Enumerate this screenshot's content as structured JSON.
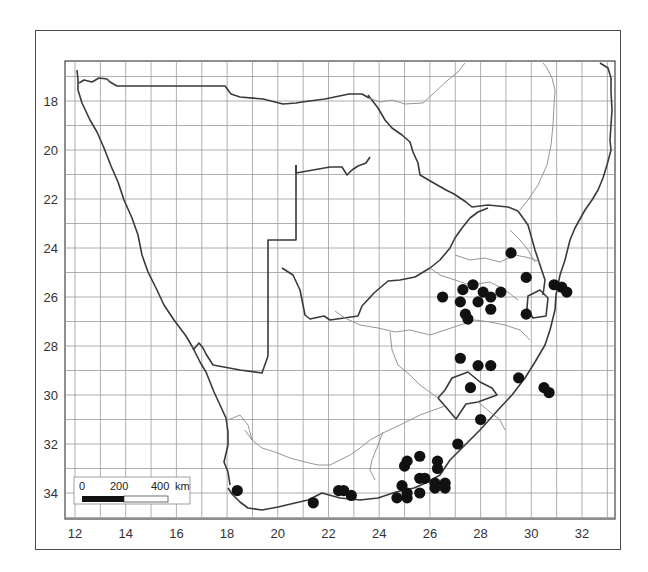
{
  "map": {
    "type": "distribution-map",
    "region": "Southern Africa",
    "x_axis": {
      "label": "Longitude (E)",
      "ticks": [
        "12",
        "14",
        "16",
        "18",
        "20",
        "22",
        "24",
        "26",
        "28",
        "30",
        "32"
      ],
      "range": [
        11.6,
        33.3
      ]
    },
    "y_axis": {
      "label": "Latitude (S)",
      "ticks": [
        "18",
        "20",
        "22",
        "24",
        "26",
        "28",
        "30",
        "32",
        "34"
      ],
      "range": [
        16.4,
        35.1
      ]
    },
    "grid": {
      "spacing_degrees": 1,
      "on": true
    },
    "scale_bar": {
      "labels": [
        "0",
        "200",
        "400"
      ],
      "unit": "km"
    },
    "marker_style": {
      "shape": "filled-circle",
      "color": "#111111"
    },
    "colors": {
      "grid": "#9a9a9a",
      "border_major": "#3a3a3a",
      "border_minor": "#8a8a8a",
      "frame": "#4a4a4a"
    }
  },
  "chart_data": {
    "type": "scatter",
    "title": "",
    "xlabel": "Longitude",
    "ylabel": "Latitude (S)",
    "xlim": [
      11.6,
      33.3
    ],
    "ylim": [
      35.1,
      16.4
    ],
    "grid": true,
    "points_lon_lat": [
      [
        29.2,
        24.2
      ],
      [
        26.5,
        26.0
      ],
      [
        27.3,
        25.7
      ],
      [
        27.7,
        25.5
      ],
      [
        27.2,
        26.2
      ],
      [
        27.4,
        26.7
      ],
      [
        27.5,
        26.9
      ],
      [
        27.9,
        26.2
      ],
      [
        28.1,
        25.8
      ],
      [
        28.4,
        26.0
      ],
      [
        28.8,
        25.8
      ],
      [
        28.4,
        26.5
      ],
      [
        29.8,
        25.2
      ],
      [
        29.8,
        26.7
      ],
      [
        30.9,
        25.5
      ],
      [
        31.2,
        25.6
      ],
      [
        31.4,
        25.8
      ],
      [
        27.2,
        28.5
      ],
      [
        27.9,
        28.8
      ],
      [
        28.4,
        28.8
      ],
      [
        29.5,
        29.3
      ],
      [
        27.6,
        29.7
      ],
      [
        30.5,
        29.7
      ],
      [
        30.7,
        29.9
      ],
      [
        28.0,
        31.0
      ],
      [
        27.1,
        32.0
      ],
      [
        25.6,
        32.5
      ],
      [
        25.1,
        32.7
      ],
      [
        25.0,
        32.9
      ],
      [
        26.3,
        32.7
      ],
      [
        26.3,
        33.0
      ],
      [
        25.6,
        33.4
      ],
      [
        25.8,
        33.4
      ],
      [
        26.2,
        33.6
      ],
      [
        26.6,
        33.6
      ],
      [
        26.2,
        33.8
      ],
      [
        26.6,
        33.8
      ],
      [
        24.9,
        33.7
      ],
      [
        25.1,
        34.0
      ],
      [
        25.1,
        34.2
      ],
      [
        25.6,
        34.0
      ],
      [
        24.7,
        34.2
      ],
      [
        18.4,
        33.9
      ],
      [
        21.4,
        34.4
      ],
      [
        22.4,
        33.9
      ],
      [
        22.6,
        33.9
      ],
      [
        22.9,
        34.1
      ]
    ]
  }
}
